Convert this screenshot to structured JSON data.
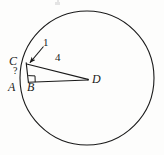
{
  "figure": {
    "kind": "circle-geometry-diagram",
    "background_color": "#fdfdfc",
    "stroke_color": "#1a1a1a",
    "canvas": {
      "width": 164,
      "height": 155
    }
  },
  "circle": {
    "name": "main-circle",
    "center_x": 87,
    "center_y": 78,
    "radius": 67,
    "stroke_width": 1.1,
    "fill": "none"
  },
  "points": [
    {
      "id": "C",
      "label": "C",
      "x": 25.5,
      "y": 62.5,
      "label_x": 11,
      "label_y": 55
    },
    {
      "id": "A",
      "label": "A",
      "x": 23.0,
      "y": 82.0,
      "label_x": 9,
      "label_y": 81
    },
    {
      "id": "B",
      "label": "B",
      "x": 28.5,
      "y": 82.0,
      "label_x": 26,
      "label_y": 81
    },
    {
      "id": "D",
      "label": "D",
      "x": 88.0,
      "y": 79.0,
      "label_x": 93,
      "label_y": 73
    }
  ],
  "segments": [
    {
      "id": "CB",
      "from": "C",
      "to": "B",
      "note": "vertical leg"
    },
    {
      "id": "BD",
      "from": "B",
      "to": "D",
      "note": "horizontal leg"
    },
    {
      "id": "CD",
      "from": "C",
      "to": "D",
      "note": "hypotenuse"
    }
  ],
  "measures": {
    "cb_length": {
      "text": "1",
      "x": 44,
      "y": 40,
      "target_x": 28,
      "target_y": 63
    },
    "cd_length": {
      "text": "4",
      "x": 55,
      "y": 52
    },
    "unknown_angle": {
      "text": "?",
      "x": 13,
      "y": 67
    }
  },
  "right_angle": {
    "name": "right-angle-marker",
    "vertex_x": 28.5,
    "vertex_y": 82.0,
    "size": 6.5
  },
  "arrow": {
    "name": "leader-arrow-to-C",
    "from_x": 43,
    "from_y": 46,
    "to_x": 28.5,
    "to_y": 63.5
  },
  "specks": [
    {
      "x": 55,
      "y": 2,
      "w": 5,
      "h": 3
    },
    {
      "x": 57,
      "y": 1,
      "w": 2,
      "h": 2
    }
  ]
}
